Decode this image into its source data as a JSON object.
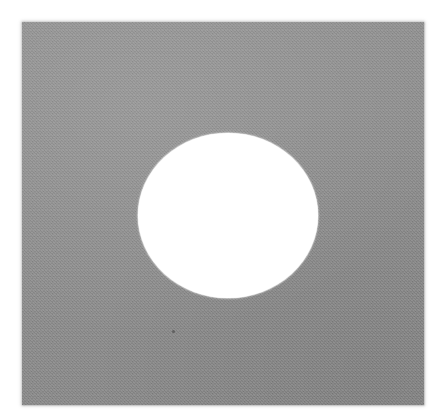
{
  "image": {
    "kind": "natural-image",
    "description": "Gray square plate with a white circular aperture near the center",
    "canvas": {
      "width": 444,
      "height": 419,
      "background_color": "#ffffff"
    },
    "plate": {
      "label": "gray square plate",
      "fill_color": "#8a8a8a",
      "left": 22,
      "top": 22,
      "width": 402,
      "height": 383,
      "texture": "fine photographic grain",
      "edge": "soft irregular scanned edge"
    },
    "aperture": {
      "label": "white circular aperture",
      "fill_color": "#ffffff",
      "center_x": 228,
      "center_y": 215,
      "width": 180,
      "height": 165,
      "shape": "ellipse"
    },
    "speck": {
      "label": "dark speck",
      "fill_color": "#3c3c3c",
      "center_x": 173,
      "center_y": 331,
      "size": 3
    }
  }
}
